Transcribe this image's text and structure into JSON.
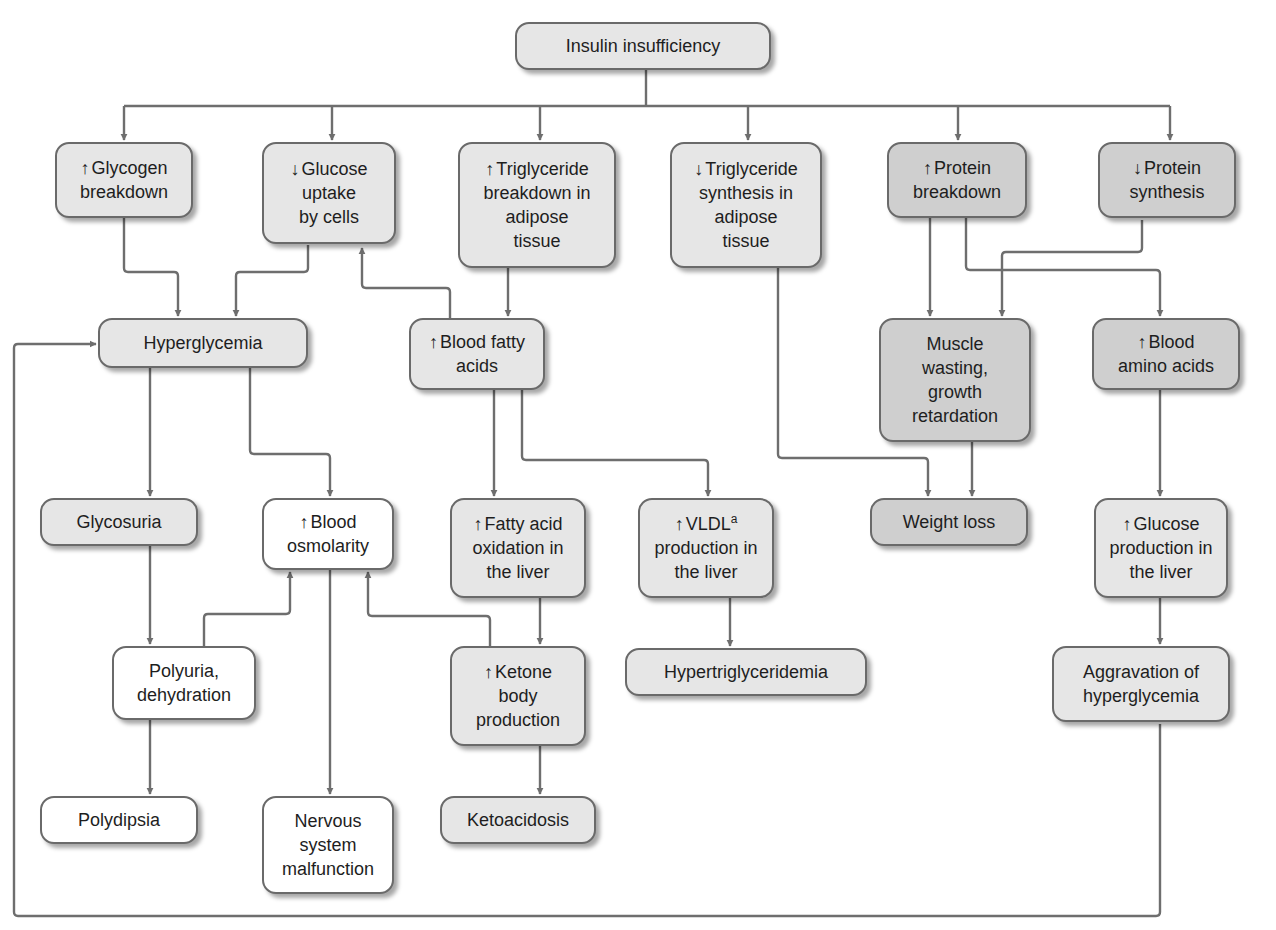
{
  "colors": {
    "white_fill": "#ffffff",
    "light_fill": "#e6e6e6",
    "dark_fill": "#cfcfcf",
    "stroke": "#6e6e6e",
    "border": "#6a6a6a"
  },
  "arrow_glyphs": {
    "up": "↑",
    "down": "↓"
  },
  "nodes": {
    "insulin_insufficiency": {
      "label": "Insulin insufficiency",
      "indicator": "",
      "shade": "light"
    },
    "glycogen_breakdown": {
      "label": "Glycogen\nbreakdown",
      "indicator": "↑",
      "shade": "light"
    },
    "glucose_uptake": {
      "label": "Glucose\nuptake\nby cells",
      "indicator": "↓",
      "shade": "light"
    },
    "tg_breakdown": {
      "label": "Triglyceride\nbreakdown in\nadipose\ntissue",
      "indicator": "↑",
      "shade": "light"
    },
    "tg_synthesis": {
      "label": "Triglyceride\nsynthesis in\nadipose\ntissue",
      "indicator": "↓",
      "shade": "light"
    },
    "protein_breakdown": {
      "label": "Protein\nbreakdown",
      "indicator": "↑",
      "shade": "dark"
    },
    "protein_synthesis": {
      "label": "Protein\nsynthesis",
      "indicator": "↓",
      "shade": "dark"
    },
    "hyperglycemia": {
      "label": "Hyperglycemia",
      "indicator": "",
      "shade": "light"
    },
    "blood_fatty_acids": {
      "label": "Blood fatty\nacids",
      "indicator": "↑",
      "shade": "light"
    },
    "muscle_wasting": {
      "label": "Muscle\nwasting,\ngrowth\nretardation",
      "indicator": "",
      "shade": "dark"
    },
    "blood_amino_acids": {
      "label": "Blood\namino acids",
      "indicator": "↑",
      "shade": "dark"
    },
    "glycosuria": {
      "label": "Glycosuria",
      "indicator": "",
      "shade": "light"
    },
    "blood_osmolarity": {
      "label": "Blood\nosmolarity",
      "indicator": "↑",
      "shade": "white"
    },
    "fa_oxidation": {
      "label": "Fatty acid\noxidation in\nthe liver",
      "indicator": "↑",
      "shade": "light"
    },
    "vldl_production": {
      "label": "VLDL",
      "superscript": "a",
      "label_rest": "\nproduction in\nthe liver",
      "indicator": "↑",
      "shade": "light"
    },
    "weight_loss": {
      "label": "Weight loss",
      "indicator": "",
      "shade": "dark"
    },
    "glucose_production": {
      "label": "Glucose\nproduction in\nthe liver",
      "indicator": "↑",
      "shade": "light"
    },
    "polyuria": {
      "label": "Polyuria,\ndehydration",
      "indicator": "",
      "shade": "white"
    },
    "ketone_production": {
      "label": "Ketone\nbody\nproduction",
      "indicator": "↑",
      "shade": "light"
    },
    "hypertriglyceridemia": {
      "label": "Hypertriglyceridemia",
      "indicator": "",
      "shade": "light"
    },
    "aggravation": {
      "label": "Aggravation of\nhyperglycemia",
      "indicator": "",
      "shade": "light"
    },
    "polydipsia": {
      "label": "Polydipsia",
      "indicator": "",
      "shade": "white"
    },
    "nervous_system": {
      "label": "Nervous\nsystem\nmalfunction",
      "indicator": "",
      "shade": "white"
    },
    "ketoacidosis": {
      "label": "Ketoacidosis",
      "indicator": "",
      "shade": "light"
    }
  },
  "edges": [
    [
      "insulin_insufficiency",
      "glycogen_breakdown"
    ],
    [
      "insulin_insufficiency",
      "glucose_uptake"
    ],
    [
      "insulin_insufficiency",
      "tg_breakdown"
    ],
    [
      "insulin_insufficiency",
      "tg_synthesis"
    ],
    [
      "insulin_insufficiency",
      "protein_breakdown"
    ],
    [
      "insulin_insufficiency",
      "protein_synthesis"
    ],
    [
      "glycogen_breakdown",
      "hyperglycemia"
    ],
    [
      "glucose_uptake",
      "hyperglycemia"
    ],
    [
      "tg_breakdown",
      "blood_fatty_acids"
    ],
    [
      "blood_fatty_acids",
      "glucose_uptake"
    ],
    [
      "blood_fatty_acids",
      "fa_oxidation"
    ],
    [
      "blood_fatty_acids",
      "vldl_production"
    ],
    [
      "tg_synthesis",
      "weight_loss"
    ],
    [
      "protein_breakdown",
      "muscle_wasting"
    ],
    [
      "protein_breakdown",
      "blood_amino_acids"
    ],
    [
      "protein_synthesis",
      "muscle_wasting"
    ],
    [
      "muscle_wasting",
      "weight_loss"
    ],
    [
      "blood_amino_acids",
      "glucose_production"
    ],
    [
      "glucose_production",
      "aggravation"
    ],
    [
      "aggravation",
      "hyperglycemia"
    ],
    [
      "hyperglycemia",
      "glycosuria"
    ],
    [
      "hyperglycemia",
      "blood_osmolarity"
    ],
    [
      "glycosuria",
      "polyuria"
    ],
    [
      "polyuria",
      "blood_osmolarity"
    ],
    [
      "polyuria",
      "polydipsia"
    ],
    [
      "blood_osmolarity",
      "nervous_system"
    ],
    [
      "fa_oxidation",
      "ketone_production"
    ],
    [
      "ketone_production",
      "blood_osmolarity"
    ],
    [
      "ketone_production",
      "ketoacidosis"
    ],
    [
      "vldl_production",
      "hypertriglyceridemia"
    ]
  ]
}
